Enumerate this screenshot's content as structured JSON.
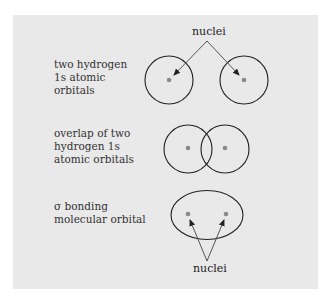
{
  "rows": [
    {
      "label": "two hydrogen\n1s atomic\norbitals"
    },
    {
      "label": "overlap of two\nhydrogen 1s\natomic orbitals"
    },
    {
      "label": "σ bonding\nmolecular orbital"
    }
  ],
  "callouts": {
    "top": "nuclei",
    "bottom": "nuclei"
  },
  "colors": {
    "panel": "#e9e9e9",
    "outline": "#222222",
    "nucleus": "#8a8a8a"
  }
}
